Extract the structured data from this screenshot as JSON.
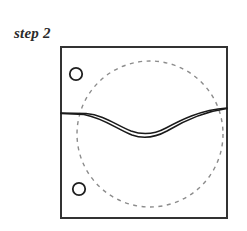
{
  "figure": {
    "label": "step 2",
    "caption_position": "top-left",
    "background_color": "#ffffff",
    "frame": {
      "name": "square-frame",
      "x": 61,
      "y": 47,
      "width": 166,
      "height": 171,
      "stroke_color": "#333333",
      "stroke_width": 2,
      "fill": "none"
    },
    "dashed_circle": {
      "name": "dashed-construction-circle",
      "cx": 150,
      "cy": 134,
      "r": 73,
      "stroke_color": "#8c8c8c",
      "stroke_width": 1.4,
      "dash_length": 4,
      "dash_gap": 4.5,
      "fill": "none"
    },
    "small_circles": [
      {
        "name": "upper-small-circle",
        "cx": 76,
        "cy": 74,
        "r": 6.2,
        "stroke_color": "#1f1f1f",
        "stroke_width": 1.8,
        "fill": "none"
      },
      {
        "name": "lower-small-circle",
        "cx": 79,
        "cy": 189,
        "r": 6.2,
        "stroke_color": "#1f1f1f",
        "stroke_width": 1.8,
        "fill": "none"
      }
    ],
    "curves": [
      {
        "name": "upper-wave-curve",
        "stroke_color": "#1a1a1a",
        "stroke_width": 1.5,
        "path": "M 61 113 L 86 113.5 C 104 115 116 125 131 131 C 142 135 155 134 166 128 C 181 120 200 110 227 108"
      },
      {
        "name": "lower-wave-curve",
        "stroke_color": "#1a1a1a",
        "stroke_width": 1.6,
        "path": "M 61 113.5 L 84 114.5 C 103 118 117 129 132 135 C 143 139 156 137 167 131 C 182 122 201 112 227 108.5"
      }
    ]
  }
}
